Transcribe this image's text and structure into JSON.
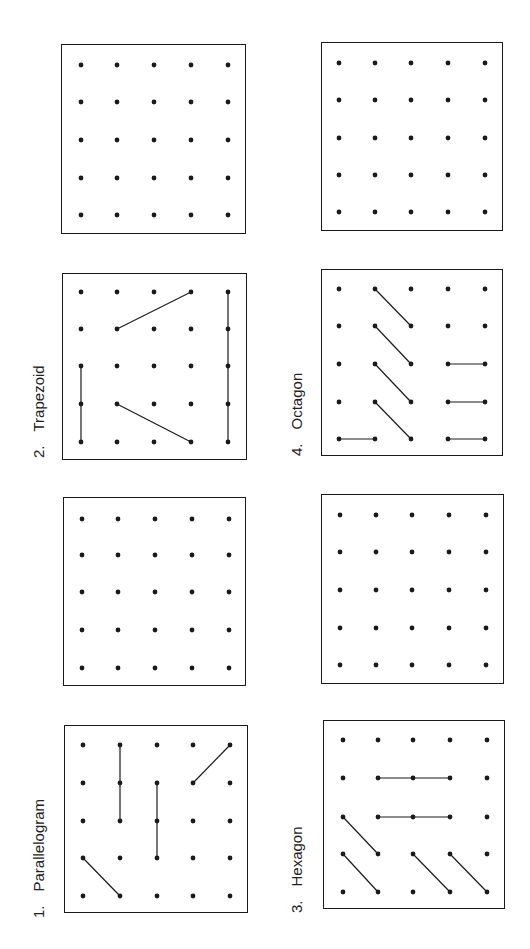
{
  "colors": {
    "ink": "#1a1a1a",
    "paper": "#ffffff"
  },
  "orientation": "page rotated 90deg counter-clockwise",
  "grid": {
    "rows": 5,
    "cols": 5
  },
  "exercises": [
    {
      "number": "1.",
      "label": "Parallelogram",
      "box": {
        "x": 64,
        "y": 725,
        "w": 184,
        "h": 188
      },
      "label_pos": {
        "x": 30,
        "y": 918
      },
      "dots_x": [
        82,
        119,
        156,
        192,
        229
      ],
      "dots_y": [
        744,
        782,
        820,
        857,
        895
      ],
      "segments": [
        [
          [
            1,
            0
          ],
          [
            1,
            2
          ]
        ],
        [
          [
            2,
            1
          ],
          [
            2,
            3
          ]
        ],
        [
          [
            3,
            1
          ],
          [
            4,
            0
          ]
        ],
        [
          [
            0,
            3
          ],
          [
            1,
            4
          ]
        ]
      ],
      "blank_box": {
        "x": 63,
        "y": 497,
        "w": 183,
        "h": 189,
        "dots_x": [
          81,
          117,
          154,
          191,
          228
        ],
        "dots_y": [
          518,
          554,
          591,
          629,
          667
        ]
      }
    },
    {
      "number": "2.",
      "label": "Trapezoid",
      "box": {
        "x": 62,
        "y": 273,
        "w": 185,
        "h": 187
      },
      "label_pos": {
        "x": 30,
        "y": 458
      },
      "dots_x": [
        80,
        116,
        153,
        190,
        227
      ],
      "dots_y": [
        291,
        328,
        365,
        403,
        441
      ],
      "segments": [
        [
          [
            0,
            2
          ],
          [
            0,
            4
          ]
        ],
        [
          [
            1,
            1
          ],
          [
            3,
            0
          ]
        ],
        [
          [
            1,
            3
          ],
          [
            3,
            4
          ]
        ],
        [
          [
            4,
            0
          ],
          [
            4,
            4
          ]
        ]
      ],
      "blank_box": {
        "x": 61,
        "y": 44,
        "w": 185,
        "h": 190,
        "dots_x": [
          80,
          116,
          153,
          190,
          227
        ],
        "dots_y": [
          64,
          101,
          139,
          177,
          214
        ]
      }
    },
    {
      "number": "3.",
      "label": "Hexagon",
      "box": {
        "x": 323,
        "y": 720,
        "w": 182,
        "h": 189
      },
      "label_pos": {
        "x": 288,
        "y": 913
      },
      "dots_x": [
        342,
        377,
        412,
        449,
        486
      ],
      "dots_y": [
        739,
        777,
        816,
        853,
        891
      ],
      "segments": [
        [
          [
            1,
            1
          ],
          [
            3,
            1
          ]
        ],
        [
          [
            1,
            2
          ],
          [
            3,
            2
          ]
        ],
        [
          [
            0,
            2
          ],
          [
            1,
            3
          ]
        ],
        [
          [
            0,
            3
          ],
          [
            1,
            4
          ]
        ],
        [
          [
            2,
            3
          ],
          [
            3,
            4
          ]
        ],
        [
          [
            3,
            3
          ],
          [
            4,
            4
          ]
        ]
      ],
      "blank_box": {
        "x": 321,
        "y": 494,
        "w": 183,
        "h": 190,
        "dots_x": [
          339,
          375,
          411,
          448,
          485
        ],
        "dots_y": [
          514,
          551,
          589,
          627,
          664
        ]
      }
    },
    {
      "number": "4.",
      "label": "Octagon",
      "box": {
        "x": 321,
        "y": 269,
        "w": 182,
        "h": 187
      },
      "label_pos": {
        "x": 288,
        "y": 456
      },
      "dots_x": [
        338,
        374,
        410,
        447,
        484
      ],
      "dots_y": [
        288,
        325,
        363,
        401,
        438
      ],
      "segments": [
        [
          [
            1,
            0
          ],
          [
            2,
            1
          ]
        ],
        [
          [
            1,
            1
          ],
          [
            2,
            2
          ]
        ],
        [
          [
            1,
            2
          ],
          [
            2,
            3
          ]
        ],
        [
          [
            1,
            3
          ],
          [
            2,
            4
          ]
        ],
        [
          [
            0,
            4
          ],
          [
            1,
            4
          ]
        ],
        [
          [
            3,
            2
          ],
          [
            4,
            2
          ]
        ],
        [
          [
            3,
            3
          ],
          [
            4,
            3
          ]
        ],
        [
          [
            3,
            4
          ],
          [
            4,
            4
          ]
        ]
      ],
      "blank_box": {
        "x": 321,
        "y": 42,
        "w": 182,
        "h": 189,
        "dots_x": [
          338,
          374,
          410,
          447,
          484
        ],
        "dots_y": [
          62,
          99,
          137,
          174,
          211
        ]
      }
    }
  ]
}
